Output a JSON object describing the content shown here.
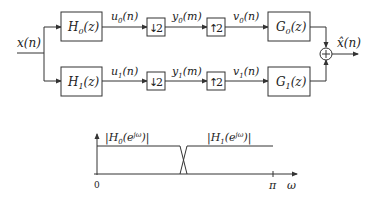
{
  "diagram": {
    "input": {
      "label": "x(n)"
    },
    "output": {
      "label": "x̂(n)"
    },
    "branches": [
      {
        "analysis_filter": {
          "name": "H",
          "sub": "0",
          "arg": "(z)"
        },
        "analysis_out": {
          "name": "u",
          "sub": "0",
          "arg": "(n)"
        },
        "downsampler": {
          "label": "2",
          "arrow": "↓"
        },
        "down_out": {
          "name": "y",
          "sub": "0",
          "arg": "(m)"
        },
        "upsampler": {
          "label": "2",
          "arrow": "↑"
        },
        "up_out": {
          "name": "v",
          "sub": "0",
          "arg": "(n)"
        },
        "synthesis_filter": {
          "name": "G",
          "sub": "0",
          "arg": "(z)"
        }
      },
      {
        "analysis_filter": {
          "name": "H",
          "sub": "1",
          "arg": "(z)"
        },
        "analysis_out": {
          "name": "u",
          "sub": "1",
          "arg": "(n)"
        },
        "downsampler": {
          "label": "2",
          "arrow": "↓"
        },
        "down_out": {
          "name": "y",
          "sub": "1",
          "arg": "(m)"
        },
        "upsampler": {
          "label": "2",
          "arrow": "↑"
        },
        "up_out": {
          "name": "v",
          "sub": "1",
          "arg": "(n)"
        },
        "synthesis_filter": {
          "name": "G",
          "sub": "1",
          "arg": "(z)"
        }
      }
    ],
    "adder": {
      "symbol": "+"
    }
  },
  "response_plot": {
    "h0_label": {
      "pre": "|H",
      "sub": "0",
      "mid": "(e",
      "sup": "jω",
      "post": ")|"
    },
    "h1_label": {
      "pre": "|H",
      "sub": "1",
      "mid": "(e",
      "sup": "jω",
      "post": ")|"
    },
    "x_tick_0": "0",
    "x_tick_pi": "π",
    "x_axis_label": "ω"
  }
}
